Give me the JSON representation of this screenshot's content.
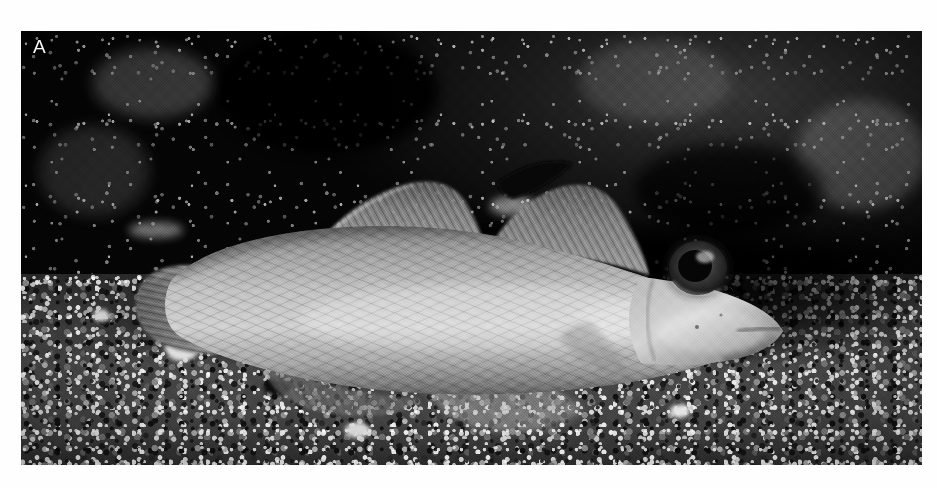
{
  "figure": {
    "panel_label": "A",
    "kind": "photograph",
    "color_mode": "black-and-white",
    "plate": {
      "left": 21,
      "top": 31,
      "width": 901,
      "height": 434,
      "page_background_color": "#ffffff",
      "label_color": "#f2f2f2",
      "background_color": "#0a0a0a"
    },
    "scene": {
      "background_description": "dark out-of-focus rubble and coral debris with scattered bright specks",
      "substrate_description": "coarse pale sand mixed with dark and bright gravel grains",
      "shadow_description": "deep dark shadow trough beneath the fish body",
      "bright_pebble_description": "prominent pale shell fragment below the tail",
      "substrate_tone": "#4a4a4a",
      "background_tone": "#1b1b1b"
    },
    "specimen": {
      "orientation": "facing right, lateral view",
      "body_tone": "#b6b6b6",
      "body_description": "elongate tapering body with fine crosshatched scale pattern",
      "parts": [
        {
          "name": "caudal-fin",
          "label": "caudal fin",
          "note": "rounded, ray-striated, at left end of body"
        },
        {
          "name": "first-dorsal-fin",
          "label": "first dorsal fin",
          "note": "triangular, ray-striated, mid-back"
        },
        {
          "name": "second-dorsal-fin",
          "label": "second dorsal fin",
          "note": "long, low, with dark blotch at leading tip"
        },
        {
          "name": "dorsal-blotch",
          "label": "dark dorsal blotch",
          "note": "black marking on second dorsal fin tip"
        },
        {
          "name": "anal-fin",
          "label": "anal fin",
          "note": "translucent, along lower body"
        },
        {
          "name": "pelvic-fin",
          "label": "pelvic fin",
          "note": "pale rayed fin under belly on substrate"
        },
        {
          "name": "pectoral-fin",
          "label": "pectoral fin",
          "note": "faint fan behind head"
        },
        {
          "name": "eye",
          "label": "eye",
          "note": "large, dark pupil with lighter iris ring"
        },
        {
          "name": "mouth",
          "label": "mouth",
          "note": "terminal, slightly oblique at snout tip"
        },
        {
          "name": "operculum",
          "label": "gill cover",
          "note": "pale smooth cheek behind eye"
        }
      ],
      "eye": {
        "center_x": 698,
        "center_y": 268,
        "pupil_color": "#101010",
        "iris_color": "#9a9a9a"
      }
    }
  }
}
